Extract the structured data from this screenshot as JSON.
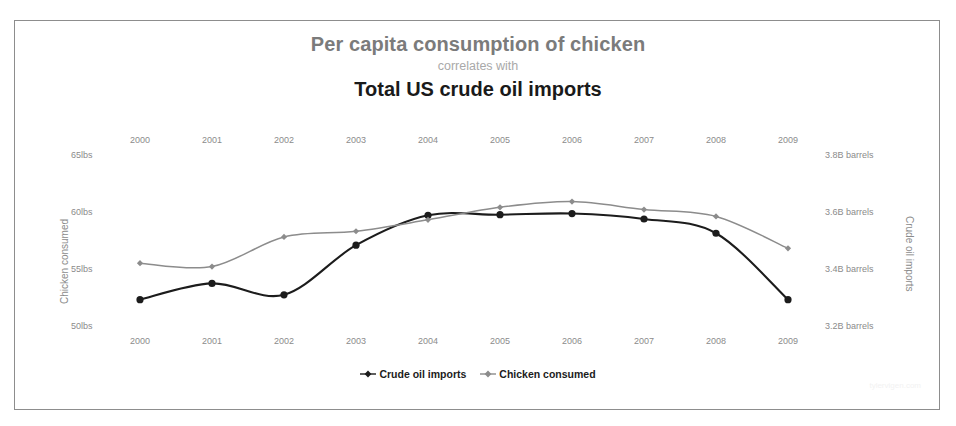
{
  "chart_data": {
    "type": "line",
    "title": "Per capita consumption of chicken",
    "subtitle": "correlates with",
    "title2": "Total US crude oil imports",
    "xlabel": "",
    "ylabel": "Chicken consumed",
    "ylabel_right": "Crude oil imports",
    "categories": [
      "2000",
      "2001",
      "2002",
      "2003",
      "2004",
      "2005",
      "2006",
      "2007",
      "2008",
      "2009"
    ],
    "x_ticks_top": [
      "2000",
      "2001",
      "2002",
      "2003",
      "2004",
      "2005",
      "2006",
      "2007",
      "2008",
      "2009"
    ],
    "x_ticks_bottom": [
      "2000",
      "2001",
      "2002",
      "2003",
      "2004",
      "2005",
      "2006",
      "2007",
      "2008",
      "2009"
    ],
    "y_ticks_left": [
      "65lbs",
      "60lbs",
      "55lbs",
      "50lbs"
    ],
    "y_ticks_left_values": [
      65,
      60,
      55,
      50
    ],
    "ylim_left": [
      48.7,
      66.5
    ],
    "y_ticks_right": [
      "3.8B barrels",
      "3.6B barrels",
      "3.4B barrels",
      "3.2B barrels"
    ],
    "y_ticks_right_values": [
      3.8,
      3.6,
      3.4,
      3.2
    ],
    "ylim_right": [
      3.148,
      3.86
    ],
    "grid": false,
    "legend_position": "bottom",
    "series": [
      {
        "name": "Crude oil imports",
        "axis": "right",
        "color": "#1c1c1c",
        "marker": "circle",
        "values": [
          3.296,
          3.353,
          3.313,
          3.487,
          3.592,
          3.594,
          3.598,
          3.579,
          3.529,
          3.296
        ]
      },
      {
        "name": "Chicken consumed",
        "axis": "left",
        "color": "#8c8c8c",
        "marker": "diamond",
        "values": [
          55.6,
          55.3,
          57.9,
          58.4,
          59.4,
          60.5,
          61.0,
          60.3,
          59.7,
          56.9
        ]
      }
    ]
  },
  "legend": {
    "items": [
      {
        "label": "Crude oil imports",
        "color": "#1c1c1c"
      },
      {
        "label": "Chicken consumed",
        "color": "#8c8c8c"
      }
    ]
  },
  "watermark": "tylervigen.com"
}
